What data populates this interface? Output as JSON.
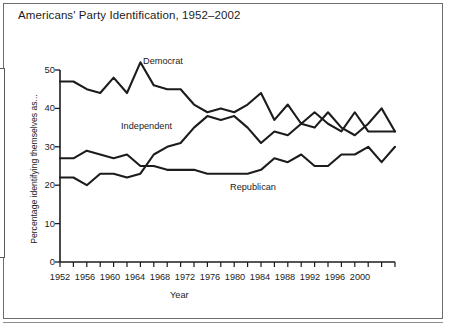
{
  "title": "Americans' Party Identification, 1952–2002",
  "axes": {
    "xlabel": "Year",
    "ylabel": "Percentage identifying themselves as...",
    "y_ticks": [
      0,
      10,
      20,
      30,
      40,
      50
    ],
    "x_tick_labels": [
      1952,
      1956,
      1960,
      1964,
      1968,
      1972,
      1976,
      1980,
      1984,
      1988,
      1992,
      1996,
      2000
    ]
  },
  "colors": {
    "line": "#1c1c1c",
    "axis": "#1c1c1c",
    "frame": "#6d6d6d",
    "background": "#ffffff"
  },
  "series_labels": {
    "democrat": "Democrat",
    "independent": "Independent",
    "republican": "Republican"
  },
  "chart_data": {
    "type": "line",
    "title": "Americans' Party Identification, 1952–2002",
    "xlabel": "Year",
    "ylabel": "Percentage identifying themselves as...",
    "xlim": [
      1952,
      2002
    ],
    "ylim": [
      0,
      52
    ],
    "yticks": [
      0,
      10,
      20,
      30,
      40,
      50
    ],
    "xticks": [
      1952,
      1954,
      1956,
      1958,
      1960,
      1962,
      1964,
      1966,
      1968,
      1970,
      1972,
      1974,
      1976,
      1978,
      1980,
      1982,
      1984,
      1986,
      1988,
      1990,
      1992,
      1994,
      1996,
      1998,
      2000,
      2002
    ],
    "xtick_labels_shown": [
      1952,
      1956,
      1960,
      1964,
      1968,
      1972,
      1976,
      1980,
      1984,
      1988,
      1992,
      1996,
      2000
    ],
    "grid": false,
    "legend": "inline-annotations",
    "x": [
      1952,
      1954,
      1956,
      1958,
      1960,
      1962,
      1964,
      1966,
      1968,
      1970,
      1972,
      1974,
      1976,
      1978,
      1980,
      1982,
      1984,
      1986,
      1988,
      1990,
      1992,
      1994,
      1996,
      1998,
      2000,
      2002
    ],
    "series": [
      {
        "name": "Democrat",
        "values": [
          47,
          47,
          45,
          44,
          48,
          44,
          52,
          46,
          45,
          45,
          41,
          39,
          40,
          39,
          41,
          44,
          37,
          41,
          36,
          39,
          36,
          34,
          39,
          34,
          34,
          34
        ]
      },
      {
        "name": "Independent",
        "values": [
          22,
          22,
          20,
          23,
          23,
          22,
          23,
          28,
          30,
          31,
          35,
          38,
          37,
          38,
          35,
          31,
          34,
          33,
          36,
          35,
          39,
          35,
          33,
          36,
          40,
          34
        ]
      },
      {
        "name": "Republican",
        "values": [
          27,
          27,
          29,
          28,
          27,
          28,
          25,
          25,
          24,
          24,
          24,
          23,
          23,
          23,
          23,
          24,
          27,
          26,
          28,
          25,
          25,
          28,
          28,
          30,
          26,
          30
        ]
      }
    ],
    "annotations": [
      {
        "text": "Democrat",
        "x": 1964.5,
        "y": 53
      },
      {
        "text": "Independent",
        "x": 1960.5,
        "y": 31
      },
      {
        "text": "Republican",
        "x": 1982.5,
        "y": 19
      }
    ]
  }
}
